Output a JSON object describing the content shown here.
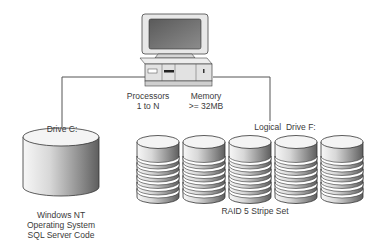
{
  "diagram": {
    "server": {
      "icon": "desktop-computer-icon",
      "processors_label": "Processors",
      "processors_value": "1 to N",
      "memory_label": "Memory",
      "memory_value": ">= 32MB"
    },
    "drive_c": {
      "label": "Drive C:",
      "icon": "single-disk-icon",
      "contents": [
        "Windows NT",
        "Operating System",
        "SQL Server Code"
      ]
    },
    "drive_f": {
      "label": "Logical  Drive F:",
      "icon": "striped-disk-icon",
      "disk_count": 5,
      "caption": "RAID 5 Stripe Set"
    },
    "colors": {
      "line": "#555555",
      "disk_top": "#f2f2f2",
      "disk_dark": "#8a8a8a",
      "monitor_screen": "#6e6e6e",
      "case": "#e6e6e6"
    }
  }
}
